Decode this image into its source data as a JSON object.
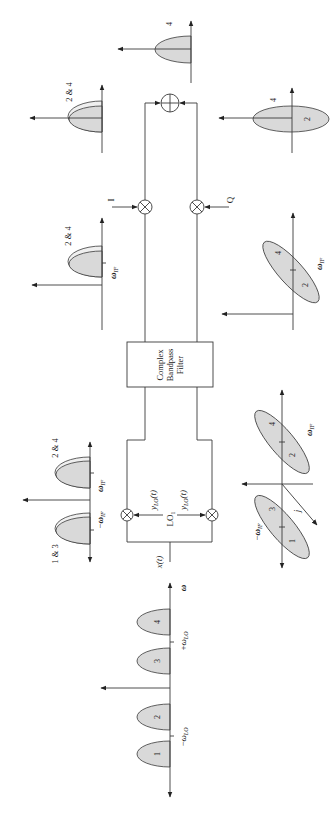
{
  "figure": {
    "input_spectrum": {
      "freq_axis_label": "ω",
      "lobe_labels": [
        "1",
        "2",
        "3",
        "4"
      ],
      "neg_lo_label": {
        "prefix": "−",
        "symbol": "ω",
        "sub": "LO"
      },
      "pos_lo_label": {
        "prefix": "+",
        "symbol": "ω",
        "sub": "LO"
      }
    },
    "downconverter": {
      "input_label": "x(t)",
      "lo_label": {
        "symbol": "LO",
        "sub": "1"
      },
      "lo_out_upper": {
        "symbol": "y",
        "sub": "LO",
        "suffix": "(t)"
      },
      "lo_out_lower": {
        "symbol": "y",
        "sub": "LO",
        "suffix": "(t)"
      }
    },
    "mixer_output_spectrum": {
      "upper_lobe_label": "2 & 4",
      "lower_lobe_label": "1 & 3",
      "pos_if_label": {
        "symbol": "ω",
        "sub": "IF"
      },
      "neg_if_label": {
        "prefix": "−",
        "symbol": "ω",
        "sub": "IF"
      }
    },
    "mixer_output_complex_spectrum": {
      "upper_lobe_labels": [
        "4",
        "2"
      ],
      "lower_lobe_labels": [
        "3",
        "1"
      ],
      "pos_if_label": {
        "symbol": "ω",
        "sub": "IF"
      },
      "neg_if_label": {
        "prefix": "−",
        "symbol": "ω",
        "sub": "IF"
      },
      "imag_axis_label": "j"
    },
    "filter": {
      "label_lines": [
        "Complex",
        "Bandpass",
        "Filter"
      ]
    },
    "filtered_spectrum": {
      "lobe_label": "2 & 4",
      "pos_if_label": {
        "symbol": "ω",
        "sub": "IF"
      }
    },
    "filtered_complex_spectrum": {
      "lobe_labels": [
        "4",
        "2"
      ],
      "pos_if_label": {
        "symbol": "ω",
        "sub": "IF"
      }
    },
    "iq_demod": {
      "i_label": "I",
      "q_label": "Q"
    },
    "baseband_i_spectrum": {
      "lobe_label": "2 & 4"
    },
    "baseband_complex_spectrum": {
      "lobe_labels": [
        "4",
        "2"
      ]
    },
    "output_spectrum": {
      "lobe_label": "4"
    },
    "colors": {
      "lobe_fill": "#d9d9d9",
      "lobe_highlight": "#efefef",
      "ink": "#3a3a3a"
    }
  }
}
